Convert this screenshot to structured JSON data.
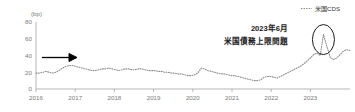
{
  "chart_data": {
    "type": "line",
    "title": "",
    "subtitle": "",
    "xlabel": "",
    "ylabel": "(bp)",
    "unit_label": "(bp)",
    "ylim": [
      0,
      80
    ],
    "yticks": [
      0,
      20,
      40,
      60,
      80
    ],
    "ytick_labels": [
      "0",
      "20",
      "40",
      "60",
      "80"
    ],
    "xlim": [
      2016,
      2023.92
    ],
    "xticks": [
      2016,
      2017,
      2018,
      2019,
      2020,
      2021,
      2022,
      2023
    ],
    "xtick_labels": [
      "2016",
      "2017",
      "2018",
      "2019",
      "2020",
      "2021",
      "2022",
      "2023"
    ],
    "grid": false,
    "legend_position": "top-right",
    "series": [
      {
        "name": "米国CDS",
        "style": "dotted",
        "color": "#8c8c8c",
        "x": [
          2016.0,
          2016.08,
          2016.17,
          2016.25,
          2016.33,
          2016.42,
          2016.5,
          2016.58,
          2016.67,
          2016.75,
          2016.83,
          2016.92,
          2017.0,
          2017.08,
          2017.17,
          2017.25,
          2017.33,
          2017.42,
          2017.5,
          2017.58,
          2017.67,
          2017.75,
          2017.83,
          2017.92,
          2018.0,
          2018.08,
          2018.17,
          2018.25,
          2018.33,
          2018.42,
          2018.5,
          2018.58,
          2018.67,
          2018.75,
          2018.83,
          2018.92,
          2019.0,
          2019.08,
          2019.17,
          2019.25,
          2019.33,
          2019.42,
          2019.5,
          2019.58,
          2019.67,
          2019.75,
          2019.83,
          2019.92,
          2020.0,
          2020.08,
          2020.17,
          2020.25,
          2020.33,
          2020.42,
          2020.5,
          2020.58,
          2020.67,
          2020.75,
          2020.83,
          2020.92,
          2021.0,
          2021.08,
          2021.17,
          2021.25,
          2021.33,
          2021.42,
          2021.5,
          2021.58,
          2021.67,
          2021.75,
          2021.83,
          2021.92,
          2022.0,
          2022.08,
          2022.17,
          2022.25,
          2022.33,
          2022.42,
          2022.5,
          2022.58,
          2022.67,
          2022.75,
          2022.83,
          2022.92,
          2023.0,
          2023.08,
          2023.17,
          2023.25,
          2023.33,
          2023.42,
          2023.5,
          2023.58,
          2023.67,
          2023.75,
          2023.83,
          2023.92
        ],
        "values": [
          19,
          19,
          20,
          21,
          20,
          19,
          20,
          22,
          25,
          27,
          28,
          28,
          27,
          26,
          25,
          24,
          23,
          22,
          22,
          23,
          24,
          24,
          25,
          24,
          23,
          22,
          23,
          24,
          24,
          23,
          23,
          24,
          24,
          23,
          22,
          22,
          22,
          21,
          21,
          20,
          20,
          19,
          19,
          18,
          18,
          17,
          16,
          16,
          17,
          19,
          25,
          24,
          22,
          21,
          20,
          19,
          18,
          18,
          17,
          16,
          16,
          15,
          14,
          13,
          12,
          11,
          10,
          10,
          11,
          14,
          15,
          15,
          14,
          13,
          15,
          17,
          19,
          21,
          23,
          25,
          27,
          30,
          33,
          37,
          41,
          43,
          40,
          65,
          52,
          38,
          35,
          37,
          41,
          45,
          47,
          46
        ]
      }
    ],
    "annotations": [
      {
        "name": "debt-ceiling-callout",
        "line1": "2023年6月",
        "line2": "米国債務上限問題",
        "highlight_shape": "ellipse",
        "highlight_target_x": 2023.25,
        "highlight_target_y": 65
      },
      {
        "name": "trend-arrow",
        "shape": "arrow-right",
        "level_y": 40,
        "color": "#000000"
      }
    ]
  },
  "legend": {
    "items": [
      {
        "label": "米国CDS",
        "marker": "dotted-line",
        "color": "#8c8c8c"
      }
    ]
  },
  "axes": {
    "y_unit": "(bp)"
  }
}
